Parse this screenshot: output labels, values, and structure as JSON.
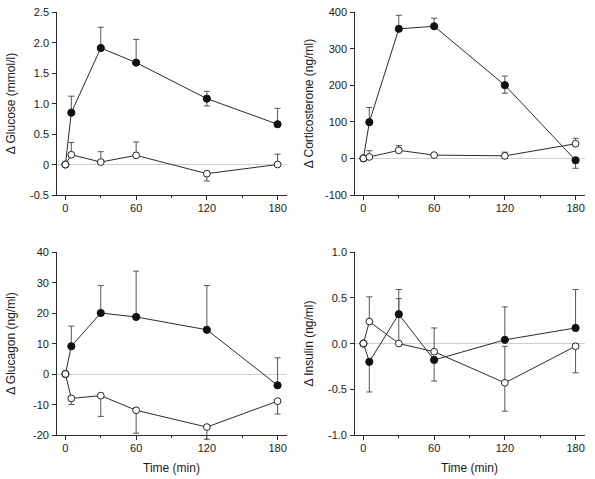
{
  "figure": {
    "title": "",
    "panel_count": 4,
    "background": "#ffffff",
    "marker_colors": {
      "filled": "#111111",
      "open_fill": "#ffffff",
      "open_stroke": "#222222"
    },
    "axis_color": "#2b2b2b",
    "zero_line_color": "#cfcfcf"
  },
  "chart_data": [
    {
      "id": "glucose",
      "type": "line",
      "title": "",
      "xlabel": "",
      "ylabel": "Δ Glucose (mmol/l)",
      "xlim": [
        -8,
        188
      ],
      "ylim": [
        -0.5,
        2.5
      ],
      "xticks": [
        0,
        60,
        120,
        180
      ],
      "xticklabels": [
        "0",
        "60",
        "120",
        "180"
      ],
      "xminorticks": [
        30,
        90,
        150
      ],
      "yticks": [
        -0.5,
        0,
        0.5,
        1.0,
        1.5,
        2.0,
        2.5
      ],
      "yticklabels": [
        "-0.5",
        "0",
        "0.5",
        "1.0",
        "1.5",
        "2.0",
        "2.5"
      ],
      "grid": false,
      "zero_line": true,
      "legend": "none",
      "x": [
        0,
        5,
        30,
        60,
        120,
        180
      ],
      "series": [
        {
          "name": "filled",
          "marker": "filled-circle",
          "values": [
            0.0,
            0.85,
            1.91,
            1.67,
            1.08,
            0.66
          ],
          "err_up": [
            0.0,
            0.27,
            0.34,
            0.38,
            0.12,
            0.26
          ],
          "err_down": [
            0.0,
            0.0,
            0.0,
            0.0,
            0.12,
            0.0
          ]
        },
        {
          "name": "open",
          "marker": "open-circle",
          "values": [
            0.0,
            0.16,
            0.04,
            0.15,
            -0.15,
            0.0
          ],
          "err_up": [
            0.0,
            0.2,
            0.17,
            0.22,
            0.0,
            0.17
          ],
          "err_down": [
            0.0,
            0.0,
            0.0,
            0.0,
            0.12,
            0.0
          ]
        }
      ]
    },
    {
      "id": "corticosterone",
      "type": "line",
      "title": "",
      "xlabel": "",
      "ylabel": "Δ Corticosterone (ng/ml)",
      "xlim": [
        -8,
        188
      ],
      "ylim": [
        -100,
        400
      ],
      "xticks": [
        0,
        60,
        120,
        180
      ],
      "xticklabels": [
        "0",
        "60",
        "120",
        "180"
      ],
      "xminorticks": [
        30,
        90,
        150
      ],
      "yticks": [
        -100,
        0,
        100,
        200,
        300,
        400
      ],
      "yticklabels": [
        "-100",
        "0",
        "100",
        "200",
        "300",
        "400"
      ],
      "grid": false,
      "zero_line": true,
      "legend": "none",
      "x": [
        0,
        5,
        30,
        60,
        120,
        180
      ],
      "series": [
        {
          "name": "filled",
          "marker": "filled-circle",
          "values": [
            0,
            99,
            354,
            361,
            200,
            -5
          ],
          "err_up": [
            0,
            40,
            37,
            22,
            25,
            0
          ],
          "err_down": [
            0,
            0,
            0,
            0,
            22,
            22
          ]
        },
        {
          "name": "open",
          "marker": "open-circle",
          "values": [
            0,
            4,
            22,
            9,
            7,
            40
          ],
          "err_up": [
            0,
            17,
            13,
            0,
            10,
            15
          ],
          "err_down": [
            0,
            0,
            0,
            0,
            0,
            0
          ]
        }
      ]
    },
    {
      "id": "glucagon",
      "type": "line",
      "title": "",
      "xlabel": "Time (min)",
      "ylabel": "Δ Glucagon (ng/ml)",
      "xlim": [
        -8,
        188
      ],
      "ylim": [
        -20,
        40
      ],
      "xticks": [
        0,
        60,
        120,
        180
      ],
      "xticklabels": [
        "0",
        "60",
        "120",
        "180"
      ],
      "xminorticks": [
        30,
        90,
        150
      ],
      "yticks": [
        -20,
        -10,
        0,
        10,
        20,
        30,
        40
      ],
      "yticklabels": [
        "-20",
        "-10",
        "0",
        "10",
        "20",
        "30",
        "40"
      ],
      "grid": false,
      "zero_line": true,
      "legend": "none",
      "x": [
        0,
        5,
        30,
        60,
        120,
        180
      ],
      "series": [
        {
          "name": "filled",
          "marker": "filled-circle",
          "values": [
            0.0,
            9.1,
            20.0,
            18.7,
            14.5,
            -3.7
          ],
          "err_up": [
            0.0,
            6.6,
            9.0,
            15.0,
            14.5,
            9.0
          ],
          "err_down": [
            0.0,
            0.0,
            0.0,
            0.0,
            0.0,
            0.0
          ]
        },
        {
          "name": "open",
          "marker": "open-circle",
          "values": [
            0.0,
            -8.0,
            -7.1,
            -11.9,
            -17.4,
            -8.9
          ],
          "err_up": [
            0.0,
            0.0,
            0.0,
            0.0,
            0.0,
            0.0
          ],
          "err_down": [
            0.0,
            2.0,
            6.8,
            7.5,
            4.0,
            4.2
          ]
        }
      ]
    },
    {
      "id": "insulin",
      "type": "line",
      "title": "",
      "xlabel": "Time (min)",
      "ylabel": "Δ Insulin (ng/ml)",
      "xlim": [
        -8,
        188
      ],
      "ylim": [
        -1.0,
        1.0
      ],
      "xticks": [
        0,
        60,
        120,
        180
      ],
      "xticklabels": [
        "0",
        "60",
        "120",
        "180"
      ],
      "xminorticks": [
        30,
        90,
        150
      ],
      "yticks": [
        -1.0,
        -0.5,
        0.0,
        0.5,
        1.0
      ],
      "yticklabels": [
        "-1.0",
        "-0.5",
        "0.0",
        "0.5",
        "1.0"
      ],
      "grid": false,
      "zero_line": true,
      "legend": "none",
      "x": [
        0,
        5,
        30,
        60,
        120,
        180
      ],
      "series": [
        {
          "name": "filled",
          "marker": "filled-circle",
          "values": [
            0.0,
            -0.2,
            0.32,
            -0.18,
            0.04,
            0.17
          ],
          "err_up": [
            0.0,
            0.0,
            0.27,
            0.0,
            0.36,
            0.42
          ],
          "err_down": [
            0.0,
            0.33,
            0.0,
            0.23,
            0.0,
            0.0
          ]
        },
        {
          "name": "open",
          "marker": "open-circle",
          "values": [
            0.0,
            0.24,
            0.0,
            -0.09,
            -0.43,
            -0.03
          ],
          "err_up": [
            0.0,
            0.27,
            0.49,
            0.26,
            0.4,
            0.0
          ],
          "err_down": [
            0.0,
            0.0,
            0.0,
            0.0,
            0.31,
            0.29
          ]
        }
      ]
    }
  ]
}
